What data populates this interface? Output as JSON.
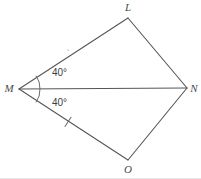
{
  "figure": {
    "type": "geometry-diagram",
    "background_color": "#ffffff",
    "stroke_color": "#56565a",
    "label_color": "#4a4a4a"
  },
  "vertices": [
    {
      "name": "L",
      "label": "L",
      "x": 128,
      "y": 18,
      "label_x": 128,
      "label_y": 11
    },
    {
      "name": "M",
      "label": "M",
      "x": 19,
      "y": 89,
      "label_x": 9,
      "label_y": 92
    },
    {
      "name": "N",
      "label": "N",
      "x": 187,
      "y": 88,
      "label_x": 194,
      "label_y": 92
    },
    {
      "name": "O",
      "label": "O",
      "x": 128,
      "y": 160,
      "label_x": 128,
      "label_y": 173
    }
  ],
  "segments": [
    {
      "name": "segment-ML",
      "from": "M",
      "to": "L",
      "x1": 19,
      "y1": 89,
      "x2": 128,
      "y2": 18,
      "ticks": 1
    },
    {
      "name": "segment-LN",
      "from": "L",
      "to": "N",
      "x1": 128,
      "y1": 18,
      "x2": 187,
      "y2": 88,
      "ticks": 0
    },
    {
      "name": "segment-MO",
      "from": "M",
      "to": "O",
      "x1": 19,
      "y1": 89,
      "x2": 128,
      "y2": 160,
      "ticks": 1
    },
    {
      "name": "segment-ON",
      "from": "O",
      "to": "N",
      "x1": 128,
      "y1": 160,
      "x2": 187,
      "y2": 88,
      "ticks": 0
    },
    {
      "name": "segment-MN-diagonal",
      "from": "M",
      "to": "N",
      "x1": 19,
      "y1": 89,
      "x2": 187,
      "y2": 88,
      "ticks": 0
    }
  ],
  "tick_marks": [
    {
      "name": "tick-ML",
      "on_segment": "segment-ML",
      "cx": 68,
      "cy": 50.1,
      "angle_deg": -33.1
    },
    {
      "name": "tick-MO",
      "on_segment": "segment-MO",
      "cx": 68,
      "cy": 121.9,
      "angle_deg": 33.1
    }
  ],
  "angles": [
    {
      "name": "angle-LMN",
      "vertex": "M",
      "value": "40°",
      "label_x": 52,
      "label_y": 76,
      "arc_path": "M 36.2 76.0 A 20 20 0 0 1 40.0 88.6"
    },
    {
      "name": "angle-OMN",
      "vertex": "M",
      "value": "40°",
      "label_x": 52,
      "label_y": 106,
      "arc_path": "M 40.0 89.4 A 20 20 0 0 1 36.2 102.0"
    }
  ]
}
